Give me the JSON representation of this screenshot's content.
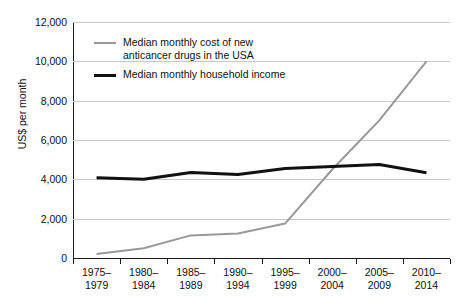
{
  "chart_data": {
    "type": "line",
    "title": "",
    "xlabel": "",
    "ylabel": "US$ per month",
    "ylim": [
      0,
      12000
    ],
    "ytick_labels": [
      "12,000",
      "10,000",
      "8,000",
      "6,000",
      "4,000",
      "2,000",
      "0"
    ],
    "yticks": [
      12000,
      10000,
      8000,
      6000,
      4000,
      2000,
      0
    ],
    "grid": true,
    "legend_position": "upper-left-inside",
    "categories": [
      "1975–\n1979",
      "1980–\n1984",
      "1985–\n1989",
      "1990–\n1994",
      "1995–\n1999",
      "2000–\n2004",
      "2005–\n2009",
      "2010–\n2014"
    ],
    "series": [
      {
        "name": "Median monthly cost of new\nanticancer drugs in the USA",
        "color": "#999999",
        "width": 2,
        "values": [
          200,
          500,
          1150,
          1250,
          1750,
          4500,
          7000,
          10000
        ]
      },
      {
        "name": "Median monthly household income",
        "color": "#111111",
        "width": 3,
        "values": [
          4080,
          4000,
          4350,
          4250,
          4550,
          4650,
          4750,
          4330
        ]
      }
    ]
  },
  "axis": {
    "y_title": "US$ per month"
  },
  "legend": {
    "items": [
      {
        "label": "Median monthly cost of new\nanticancer drugs in the USA",
        "color": "#999999",
        "weight": "thin"
      },
      {
        "label": "Median monthly household income",
        "color": "#111111",
        "weight": "thick"
      }
    ]
  },
  "colors": {
    "drug_cost_line": "#999999",
    "income_line": "#111111",
    "gridline": "#c9c9c9",
    "axis": "#1a1a1a",
    "background": "#ffffff"
  }
}
